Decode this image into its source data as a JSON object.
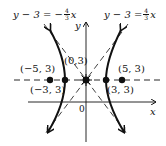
{
  "figure": {
    "asymptote_left": {
      "lhs": "y − 3 = −",
      "frac_num": "4",
      "frac_den": "3",
      "var": "x"
    },
    "asymptote_right": {
      "lhs": "y − 3 = ",
      "frac_num": "4",
      "frac_den": "3",
      "var": "x"
    },
    "points": [
      {
        "label": "(−5, 3)",
        "x": -5,
        "y": 3
      },
      {
        "label": "(−3, 3)",
        "x": -3,
        "y": 3
      },
      {
        "label": "(0,3)",
        "x": 0,
        "y": 3
      },
      {
        "label": "(3, 3)",
        "x": 3,
        "y": 3
      },
      {
        "label": "(5, 3)",
        "x": 5,
        "y": 3
      }
    ],
    "axes": {
      "x_label": "x",
      "y_label": "y",
      "origin_label": "0"
    },
    "colors": {
      "ink": "#111111",
      "background": "#ffffff"
    }
  }
}
